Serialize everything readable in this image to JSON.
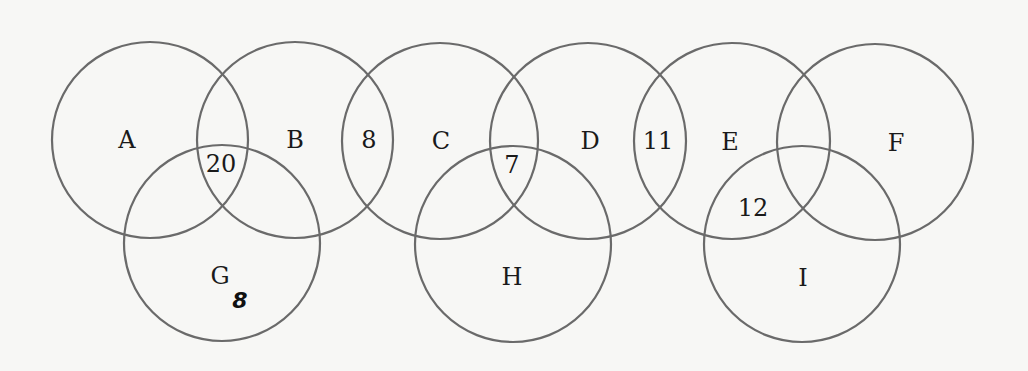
{
  "diagram": {
    "type": "venn-chain",
    "circles": [
      {
        "id": "A",
        "label": "A",
        "cx": 150,
        "cy": 140,
        "r": 98
      },
      {
        "id": "B",
        "label": "B",
        "cx": 295,
        "cy": 140,
        "r": 98
      },
      {
        "id": "C",
        "label": "C",
        "cx": 440,
        "cy": 141,
        "r": 98
      },
      {
        "id": "D",
        "label": "D",
        "cx": 588,
        "cy": 141,
        "r": 98
      },
      {
        "id": "E",
        "label": "E",
        "cx": 732,
        "cy": 141,
        "r": 98
      },
      {
        "id": "F",
        "label": "F",
        "cx": 875,
        "cy": 142,
        "r": 98
      },
      {
        "id": "G",
        "label": "G",
        "cx": 222,
        "cy": 243,
        "r": 98
      },
      {
        "id": "H",
        "label": "H",
        "cx": 513,
        "cy": 244,
        "r": 98
      },
      {
        "id": "I",
        "label": "I",
        "cx": 802,
        "cy": 244,
        "r": 98
      }
    ],
    "labels": [
      {
        "text": "A",
        "x": 127,
        "y": 140
      },
      {
        "text": "B",
        "x": 295,
        "y": 140
      },
      {
        "text": "C",
        "x": 441,
        "y": 141
      },
      {
        "text": "D",
        "x": 590,
        "y": 141
      },
      {
        "text": "E",
        "x": 730,
        "y": 142
      },
      {
        "text": "F",
        "x": 896,
        "y": 143
      },
      {
        "text": "G",
        "x": 220,
        "y": 276
      },
      {
        "text": "H",
        "x": 512,
        "y": 277
      },
      {
        "text": "I",
        "x": 803,
        "y": 278
      }
    ],
    "region_values": [
      {
        "region": "A∩B∩G",
        "text": "20",
        "x": 221,
        "y": 164
      },
      {
        "region": "B∩C",
        "text": "8",
        "x": 369,
        "y": 140
      },
      {
        "region": "C∩D∩H",
        "text": "7",
        "x": 512,
        "y": 165
      },
      {
        "region": "D∩E",
        "text": "11",
        "x": 658,
        "y": 141
      },
      {
        "region": "E∩I",
        "text": "12",
        "x": 753,
        "y": 208
      }
    ],
    "annotations": [
      {
        "text": "8",
        "style": "handwritten",
        "x": 240,
        "y": 300
      }
    ]
  }
}
